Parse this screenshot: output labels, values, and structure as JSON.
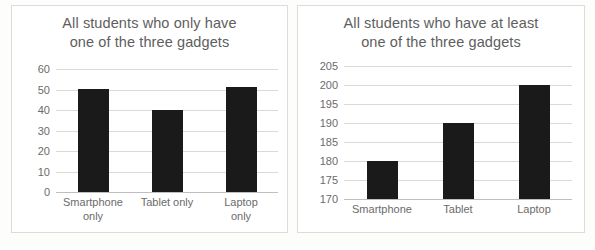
{
  "chart_data": [
    {
      "type": "bar",
      "title": "All students who only have\none of the three gadgets",
      "title_line1": "All students who only have",
      "title_line2": "one of the three gadgets",
      "categories": [
        "Smartphone only",
        "Tablet only",
        "Laptop only"
      ],
      "category_lines": [
        [
          "Smartphone",
          "only"
        ],
        [
          "Tablet only",
          ""
        ],
        [
          "Laptop only",
          ""
        ]
      ],
      "values": [
        50,
        40,
        51
      ],
      "xlabel": "",
      "ylabel": "",
      "ylim": [
        0,
        60
      ],
      "yticks": [
        60,
        50,
        40,
        30,
        20,
        10,
        0
      ],
      "grid": true,
      "legend": false,
      "bar_color": "#1a1a1a"
    },
    {
      "type": "bar",
      "title": "All students who have at least\none of the three gadgets",
      "title_line1": "All students who have at least",
      "title_line2": "one of the three gadgets",
      "categories": [
        "Smartphone",
        "Tablet",
        "Laptop"
      ],
      "category_lines": [
        [
          "Smartphone",
          ""
        ],
        [
          "Tablet",
          ""
        ],
        [
          "Laptop",
          ""
        ]
      ],
      "values": [
        180,
        190,
        200
      ],
      "xlabel": "",
      "ylabel": "",
      "ylim": [
        170,
        205
      ],
      "yticks": [
        205,
        200,
        195,
        190,
        185,
        180,
        175,
        170
      ],
      "grid": true,
      "legend": false,
      "bar_color": "#1a1a1a"
    }
  ],
  "colors": {
    "bar": "#1a1a1a",
    "gridline": "#d9d9d9",
    "title_text": "#5e5e5e",
    "tick_text": "#6b6b6b",
    "frame": "#dcdcdc",
    "background": "#ffffff"
  }
}
